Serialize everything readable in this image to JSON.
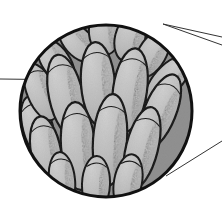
{
  "figure": {
    "kind": "scientific-line-art-illustration",
    "caption": "",
    "background_color": "#ffffff"
  },
  "inset": {
    "shape": "circle",
    "center_x": 106,
    "center_y": 111,
    "radius": 87,
    "outline_color": "#111111",
    "outline_width": 3,
    "fill_color": "#b0b0b0",
    "label": ""
  },
  "style": {
    "lobe_fill": "#b8b8b8",
    "lobe_fill_light": "#c9c9c9",
    "lobe_outline": "#111111",
    "stipple_color": "#2a2a2a",
    "leader_line_color": "#333333",
    "leader_line_width": 1
  },
  "leader_lines": [
    {
      "name": "callout-upper-right-top",
      "x1": 163,
      "y1": 24,
      "x2": 222,
      "y2": 37
    },
    {
      "name": "callout-upper-right-bottom",
      "x1": 163,
      "y1": 24,
      "x2": 222,
      "y2": 45
    },
    {
      "name": "callout-lower-right",
      "x1": 166,
      "y1": 176,
      "x2": 222,
      "y2": 141
    },
    {
      "name": "callout-left-horizontal",
      "x1": 0,
      "y1": 79,
      "x2": 81,
      "y2": 80
    }
  ],
  "lobes": [
    {
      "cx": 38,
      "cy": 128,
      "rx": 15,
      "ry": 33,
      "rot": -16
    },
    {
      "cx": 41,
      "cy": 92,
      "rx": 14,
      "ry": 30,
      "rot": -22
    },
    {
      "cx": 56,
      "cy": 62,
      "rx": 14,
      "ry": 26,
      "rot": -34
    },
    {
      "cx": 78,
      "cy": 42,
      "rx": 14,
      "ry": 24,
      "rot": -42
    },
    {
      "cx": 104,
      "cy": 33,
      "rx": 15,
      "ry": 22,
      "rot": -6
    },
    {
      "cx": 130,
      "cy": 38,
      "rx": 15,
      "ry": 24,
      "rot": 14
    },
    {
      "cx": 152,
      "cy": 54,
      "rx": 14,
      "ry": 26,
      "rot": 30
    },
    {
      "cx": 168,
      "cy": 80,
      "rx": 14,
      "ry": 30,
      "rot": 42
    },
    {
      "cx": 66,
      "cy": 96,
      "rx": 17,
      "ry": 42,
      "rot": -12
    },
    {
      "cx": 98,
      "cy": 84,
      "rx": 17,
      "ry": 42,
      "rot": -4
    },
    {
      "cx": 130,
      "cy": 90,
      "rx": 17,
      "ry": 42,
      "rot": 8
    },
    {
      "cx": 160,
      "cy": 112,
      "rx": 16,
      "ry": 40,
      "rot": 22
    },
    {
      "cx": 46,
      "cy": 152,
      "rx": 15,
      "ry": 36,
      "rot": -10
    },
    {
      "cx": 78,
      "cy": 146,
      "rx": 17,
      "ry": 44,
      "rot": -4
    },
    {
      "cx": 110,
      "cy": 140,
      "rx": 17,
      "ry": 46,
      "rot": 4
    },
    {
      "cx": 142,
      "cy": 148,
      "rx": 16,
      "ry": 42,
      "rot": 14
    },
    {
      "cx": 62,
      "cy": 180,
      "rx": 13,
      "ry": 28,
      "rot": -6
    },
    {
      "cx": 96,
      "cy": 184,
      "rx": 14,
      "ry": 28,
      "rot": 2
    },
    {
      "cx": 128,
      "cy": 182,
      "rx": 14,
      "ry": 28,
      "rot": 10
    }
  ]
}
